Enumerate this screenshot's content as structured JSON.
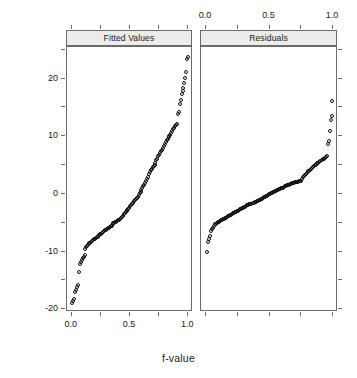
{
  "chart_data": {
    "type": "scatter",
    "title": "",
    "xlabel": "f-value",
    "ylabel": "Yield (bushels/acre)",
    "xlim": [
      -0.04,
      1.04
    ],
    "ylim": [
      -20.5,
      25.5
    ],
    "grid": false,
    "legend_position": "none",
    "marker": "open-circle",
    "x_ticks": [
      "0.0",
      "0.5",
      "1.0"
    ],
    "x_tick_values": [
      0.0,
      0.5,
      1.0
    ],
    "y_ticks": [
      "20",
      "10",
      "0",
      "-10",
      "-20"
    ],
    "y_tick_values": [
      20,
      10,
      0,
      -10,
      -20
    ],
    "y_minor_tick_values": [
      25,
      15,
      5,
      -5,
      -15
    ],
    "x_minor_tick_values": [
      0.25,
      0.75
    ],
    "panels": [
      {
        "label": "Fitted Values",
        "x": [
          0.006,
          0.014,
          0.022,
          0.03,
          0.038,
          0.046,
          0.054,
          0.062,
          0.07,
          0.078,
          0.086,
          0.094,
          0.102,
          0.11,
          0.118,
          0.126,
          0.134,
          0.142,
          0.15,
          0.158,
          0.166,
          0.174,
          0.182,
          0.19,
          0.198,
          0.206,
          0.214,
          0.222,
          0.23,
          0.238,
          0.246,
          0.254,
          0.262,
          0.27,
          0.278,
          0.286,
          0.294,
          0.302,
          0.31,
          0.318,
          0.326,
          0.334,
          0.342,
          0.35,
          0.358,
          0.366,
          0.374,
          0.382,
          0.39,
          0.398,
          0.406,
          0.414,
          0.422,
          0.43,
          0.438,
          0.446,
          0.454,
          0.462,
          0.47,
          0.478,
          0.486,
          0.494,
          0.502,
          0.51,
          0.518,
          0.526,
          0.534,
          0.542,
          0.55,
          0.558,
          0.566,
          0.574,
          0.582,
          0.59,
          0.598,
          0.606,
          0.614,
          0.622,
          0.63,
          0.638,
          0.646,
          0.654,
          0.662,
          0.67,
          0.678,
          0.686,
          0.694,
          0.702,
          0.71,
          0.718,
          0.726,
          0.734,
          0.742,
          0.75,
          0.758,
          0.766,
          0.774,
          0.782,
          0.79,
          0.798,
          0.806,
          0.814,
          0.822,
          0.83,
          0.838,
          0.846,
          0.854,
          0.862,
          0.87,
          0.878,
          0.886,
          0.894,
          0.902,
          0.91,
          0.918,
          0.926,
          0.934,
          0.942,
          0.95,
          0.958,
          0.966,
          0.974,
          0.982,
          0.99,
          0.996
        ],
        "y": [
          -19.0,
          -18.6,
          -18.2,
          -17.0,
          -16.6,
          -16.2,
          -15.8,
          -13.6,
          -12.2,
          -11.8,
          -11.4,
          -11.2,
          -10.9,
          -10.6,
          -9.6,
          -9.3,
          -9.0,
          -8.8,
          -8.6,
          -8.5,
          -8.3,
          -8.2,
          -8.0,
          -7.9,
          -7.8,
          -7.6,
          -7.5,
          -7.4,
          -7.2,
          -7.1,
          -7.0,
          -6.9,
          -6.8,
          -6.6,
          -6.5,
          -6.3,
          -6.2,
          -6.1,
          -6.0,
          -5.9,
          -5.8,
          -5.6,
          -5.5,
          -5.3,
          -5.1,
          -5.0,
          -4.9,
          -4.8,
          -4.7,
          -4.6,
          -4.5,
          -4.4,
          -4.2,
          -4.0,
          -3.8,
          -3.5,
          -3.3,
          -3.1,
          -2.9,
          -2.8,
          -2.6,
          -2.4,
          -2.1,
          -1.9,
          -1.7,
          -1.5,
          -1.3,
          -1.1,
          -0.9,
          -0.7,
          -0.5,
          -0.2,
          0.1,
          0.4,
          0.7,
          1.0,
          1.3,
          1.6,
          1.9,
          2.2,
          2.6,
          3.0,
          3.4,
          3.8,
          4.1,
          4.4,
          4.7,
          4.9,
          5.1,
          5.4,
          5.8,
          6.1,
          6.5,
          6.8,
          7.1,
          7.4,
          7.7,
          8.0,
          8.3,
          8.6,
          9.0,
          9.3,
          9.6,
          9.9,
          10.1,
          10.3,
          10.6,
          10.9,
          11.2,
          11.5,
          11.8,
          12.0,
          12.2,
          13.9,
          14.2,
          15.6,
          16.3,
          17.4,
          17.9,
          18.3,
          19.2,
          20.2,
          21.2,
          23.4,
          23.8
        ]
      },
      {
        "label": "Residuals",
        "x": [
          0.006,
          0.014,
          0.022,
          0.03,
          0.038,
          0.046,
          0.054,
          0.062,
          0.07,
          0.078,
          0.086,
          0.094,
          0.102,
          0.11,
          0.118,
          0.126,
          0.134,
          0.142,
          0.15,
          0.158,
          0.166,
          0.174,
          0.182,
          0.19,
          0.198,
          0.206,
          0.214,
          0.222,
          0.23,
          0.238,
          0.246,
          0.254,
          0.262,
          0.27,
          0.278,
          0.286,
          0.294,
          0.302,
          0.31,
          0.318,
          0.326,
          0.334,
          0.342,
          0.35,
          0.358,
          0.366,
          0.374,
          0.382,
          0.39,
          0.398,
          0.406,
          0.414,
          0.422,
          0.43,
          0.438,
          0.446,
          0.454,
          0.462,
          0.47,
          0.478,
          0.486,
          0.494,
          0.502,
          0.51,
          0.518,
          0.526,
          0.534,
          0.542,
          0.55,
          0.558,
          0.566,
          0.574,
          0.582,
          0.59,
          0.598,
          0.606,
          0.614,
          0.622,
          0.63,
          0.638,
          0.646,
          0.654,
          0.662,
          0.67,
          0.678,
          0.686,
          0.694,
          0.702,
          0.71,
          0.718,
          0.726,
          0.734,
          0.742,
          0.75,
          0.758,
          0.766,
          0.774,
          0.782,
          0.79,
          0.798,
          0.806,
          0.814,
          0.822,
          0.83,
          0.838,
          0.846,
          0.854,
          0.862,
          0.87,
          0.878,
          0.886,
          0.894,
          0.902,
          0.91,
          0.918,
          0.926,
          0.934,
          0.942,
          0.95,
          0.958,
          0.966,
          0.974,
          0.982,
          0.99,
          0.996
        ],
        "y": [
          -10.1,
          -8.4,
          -7.9,
          -7.3,
          -6.4,
          -6.1,
          -5.9,
          -5.6,
          -5.3,
          -5.2,
          -5.0,
          -4.9,
          -4.8,
          -4.7,
          -4.6,
          -4.5,
          -4.4,
          -4.3,
          -4.2,
          -4.1,
          -4.0,
          -3.9,
          -3.8,
          -3.7,
          -3.6,
          -3.5,
          -3.4,
          -3.3,
          -3.2,
          -3.1,
          -3.0,
          -2.9,
          -2.8,
          -2.7,
          -2.6,
          -2.5,
          -2.4,
          -2.3,
          -2.2,
          -2.1,
          -2.0,
          -1.9,
          -1.8,
          -1.75,
          -1.7,
          -1.6,
          -1.5,
          -1.45,
          -1.4,
          -1.3,
          -1.2,
          -1.1,
          -1.0,
          -0.9,
          -0.8,
          -0.7,
          -0.6,
          -0.5,
          -0.4,
          -0.3,
          -0.2,
          -0.1,
          0.0,
          0.1,
          0.2,
          0.3,
          0.4,
          0.5,
          0.55,
          0.6,
          0.7,
          0.8,
          0.9,
          1.0,
          1.05,
          1.1,
          1.2,
          1.3,
          1.4,
          1.5,
          1.55,
          1.6,
          1.7,
          1.8,
          1.85,
          1.9,
          1.95,
          2.0,
          2.05,
          2.1,
          2.15,
          2.2,
          2.25,
          2.3,
          2.6,
          2.9,
          3.1,
          3.3,
          3.5,
          3.7,
          3.9,
          4.0,
          4.2,
          4.4,
          4.5,
          4.7,
          4.8,
          5.0,
          5.1,
          5.3,
          5.4,
          5.6,
          5.7,
          5.9,
          6.0,
          6.1,
          6.3,
          6.4,
          6.5,
          8.7,
          9.1,
          11.0,
          12.9,
          13.5,
          16.1
        ]
      }
    ]
  }
}
